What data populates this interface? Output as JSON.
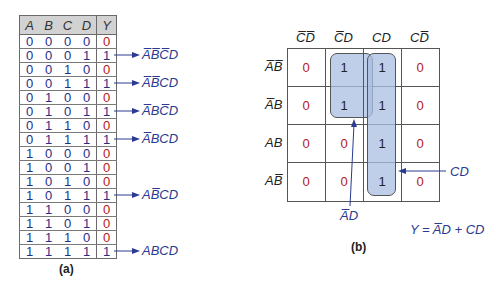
{
  "truth_table": {
    "headers": [
      "A",
      "B",
      "C",
      "D",
      "Y"
    ],
    "rows": [
      [
        "0",
        "0",
        "0",
        "0",
        "0"
      ],
      [
        "0",
        "0",
        "0",
        "1",
        "1"
      ],
      [
        "0",
        "0",
        "1",
        "0",
        "0"
      ],
      [
        "0",
        "0",
        "1",
        "1",
        "1"
      ],
      [
        "0",
        "1",
        "0",
        "0",
        "0"
      ],
      [
        "0",
        "1",
        "0",
        "1",
        "1"
      ],
      [
        "0",
        "1",
        "1",
        "0",
        "0"
      ],
      [
        "0",
        "1",
        "1",
        "1",
        "1"
      ],
      [
        "1",
        "0",
        "0",
        "0",
        "0"
      ],
      [
        "1",
        "0",
        "0",
        "1",
        "0"
      ],
      [
        "1",
        "0",
        "1",
        "0",
        "0"
      ],
      [
        "1",
        "0",
        "1",
        "1",
        "1"
      ],
      [
        "1",
        "1",
        "0",
        "0",
        "0"
      ],
      [
        "1",
        "1",
        "0",
        "1",
        "0"
      ],
      [
        "1",
        "1",
        "1",
        "0",
        "0"
      ],
      [
        "1",
        "1",
        "1",
        "1",
        "1"
      ]
    ],
    "minterms": [
      {
        "row": 1,
        "label": "A̅B̅C̅D"
      },
      {
        "row": 3,
        "label": "A̅B̅CD"
      },
      {
        "row": 5,
        "label": "A̅BC̅D"
      },
      {
        "row": 7,
        "label": "A̅BCD"
      },
      {
        "row": 11,
        "label": "AB̅CD"
      },
      {
        "row": 15,
        "label": "ABCD"
      }
    ],
    "caption": "(a)"
  },
  "kmap": {
    "col_labels": [
      "C̅D̅",
      "C̅D",
      "CD",
      "CD̅"
    ],
    "row_labels": [
      "A̅B̅",
      "A̅B",
      "AB",
      "AB̅"
    ],
    "cells": [
      [
        "0",
        "1",
        "1",
        "0"
      ],
      [
        "0",
        "1",
        "1",
        "0"
      ],
      [
        "0",
        "0",
        "1",
        "0"
      ],
      [
        "0",
        "0",
        "1",
        "0"
      ]
    ],
    "annotations": {
      "ad_label": "A̅D",
      "cd_label": "CD",
      "equation": "Y = A̅D + CD"
    },
    "caption": "(b)"
  },
  "colors": {
    "zero": "#b52020",
    "one_table": "#1f2f8a",
    "annotation": "#2a3a90",
    "loop_fill": "#aabee1",
    "header_bg": "#d2d2d2"
  }
}
